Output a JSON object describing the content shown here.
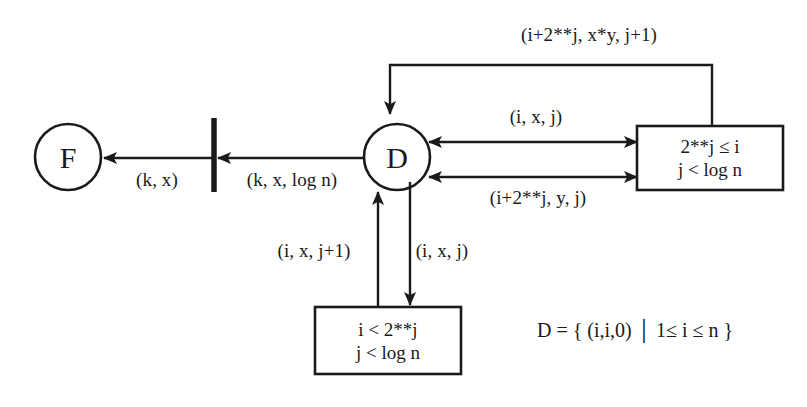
{
  "diagram": {
    "background_color": "#ffffff",
    "stroke_color": "#1a1a1a",
    "nodes": {
      "final_node": {
        "label": "F",
        "name": "final-state-node"
      },
      "start_node": {
        "label": "D",
        "name": "data-state-node"
      },
      "barrier": {
        "name": "synchronization-bar"
      }
    },
    "boxes": {
      "right_box": {
        "line1": "2**j ≤ i",
        "line2": "j < log n"
      },
      "bottom_box": {
        "line1": "i < 2**j",
        "line2": "j < log n"
      }
    },
    "edge_labels": {
      "f_input": "(k, x)",
      "bar_input": "(k, x, log n)",
      "top_feedback": "(i+2**j, x*y, j+1)",
      "right_upper": "(i, x, j)",
      "right_lower": "(i+2**j, y, j)",
      "bottom_left": "(i, x, j+1)",
      "bottom_right": "(i, x, j)"
    },
    "set_definition": "D = {  (i,i,0)  │  1≤ i ≤ n  }"
  }
}
